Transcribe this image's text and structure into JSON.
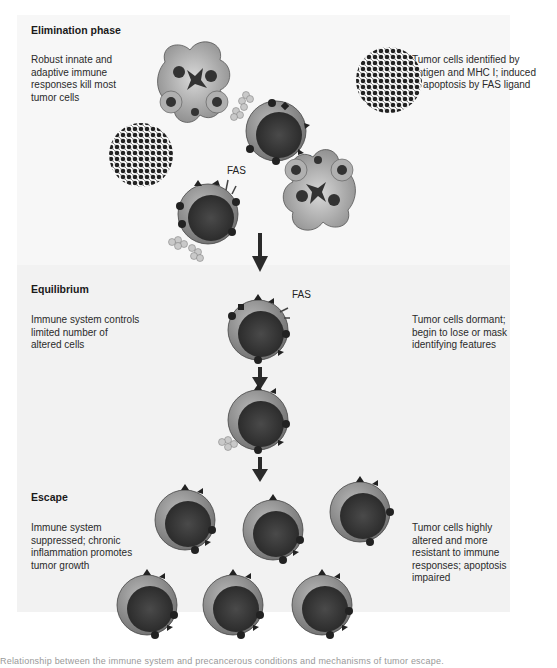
{
  "phases": [
    {
      "title": "Elimination phase",
      "left_text": "Robust innate and adaptive immune responses kill most tumor cells",
      "right_text": "Tumor cells identified by antigen and MHC I; induced to apoptosis by FAS ligand"
    },
    {
      "title": "Equilibrium",
      "left_text": "Immune system controls limited number of altered cells",
      "right_text": "Tumor cells dormant; begin to lose or mask identifying features"
    },
    {
      "title": "Escape",
      "left_text": "Immune system suppressed; chronic inflammation promotes tumor growth",
      "right_text": "Tumor cells highly altered and more resistant to immune responses; apoptosis impaired"
    }
  ],
  "labels": {
    "fas_1": "FAS",
    "fas_2": "FAS",
    "fas_3": "FAS"
  },
  "caption": "Relationship between the immune system and precancerous conditions and mechanisms of tumor escape.",
  "colors": {
    "background": "#f2f2f2",
    "cell_outer": "#8a8a8a",
    "cell_nucleus": "#333333",
    "arrow": "#2a2a2a"
  }
}
